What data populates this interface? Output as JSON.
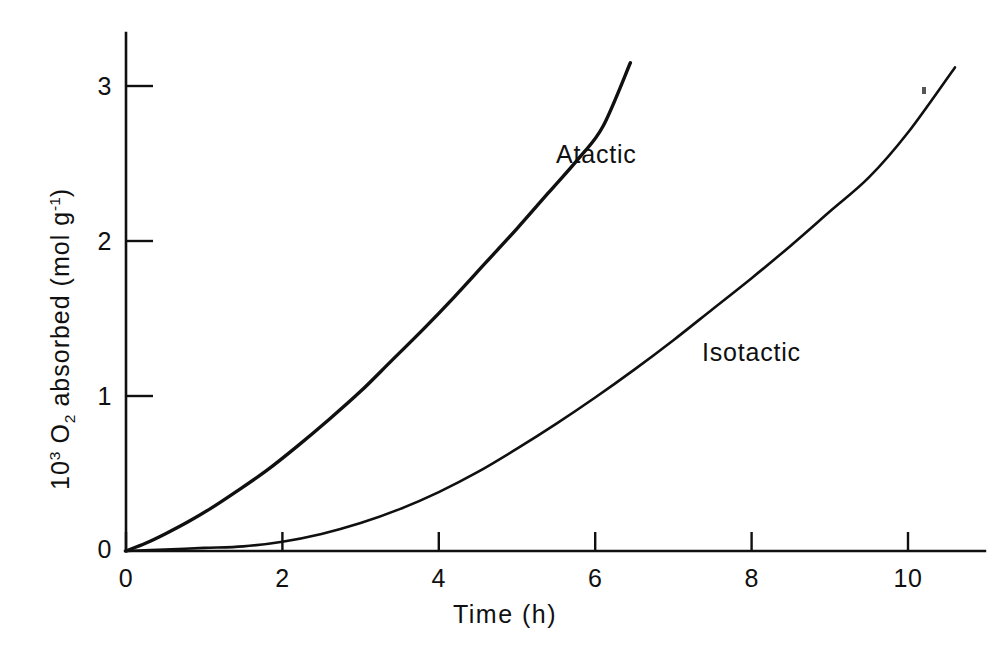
{
  "figure": {
    "background_color": "#ffffff",
    "ink_color": "#101010"
  },
  "axes": {
    "x": {
      "title": "Time (h)",
      "ticks": [
        0,
        2,
        4,
        6,
        8,
        10
      ],
      "tick_labels": [
        "0",
        "2",
        "4",
        "6",
        "8",
        "10"
      ],
      "range": [
        0,
        11.3
      ]
    },
    "y": {
      "title_parts": {
        "prefix": "10",
        "prefix_exp": "3",
        "species": "O",
        "species_sub": "2",
        "middle": " absorbed (mol g",
        "unit_exp": "-1",
        "suffix": ")"
      },
      "title_plain": "10^3 O2 absorbed (mol g^-1)",
      "ticks": [
        0,
        1,
        2,
        3
      ],
      "tick_labels": [
        "0",
        "1",
        "2",
        "3"
      ],
      "range": [
        0,
        3.34
      ]
    }
  },
  "series_labels": {
    "atactic": "Atactic",
    "isotactic": "Isotactic"
  },
  "chart_data": {
    "type": "line",
    "title": "",
    "xlabel": "Time (h)",
    "ylabel": "10^3 O2 absorbed (mol g^-1)",
    "xlim": [
      0,
      11.3
    ],
    "ylim": [
      0,
      3.34
    ],
    "xticks": [
      0,
      2,
      4,
      6,
      8,
      10
    ],
    "yticks": [
      0,
      1,
      2,
      3
    ],
    "grid": false,
    "legend": "inline-annotations",
    "annotations": [
      {
        "text": "Atactic",
        "x": 5.5,
        "y": 2.55
      },
      {
        "text": "Isotactic",
        "x": 7.35,
        "y": 1.27
      }
    ],
    "series": [
      {
        "name": "Atactic",
        "color": "#101010",
        "x": [
          0.0,
          0.25,
          0.5,
          0.8,
          1.1,
          1.4,
          1.8,
          2.2,
          2.6,
          3.0,
          3.4,
          3.8,
          4.2,
          4.6,
          5.0,
          5.4,
          5.8,
          6.1,
          6.45
        ],
        "y": [
          0.0,
          0.05,
          0.11,
          0.19,
          0.28,
          0.38,
          0.52,
          0.68,
          0.85,
          1.03,
          1.23,
          1.43,
          1.64,
          1.86,
          2.08,
          2.31,
          2.54,
          2.74,
          3.15
        ]
      },
      {
        "name": "Isotactic",
        "color": "#101010",
        "x": [
          0.0,
          0.5,
          1.0,
          1.5,
          2.0,
          2.5,
          3.0,
          3.5,
          4.0,
          4.5,
          5.0,
          5.5,
          6.0,
          6.5,
          7.0,
          7.5,
          8.0,
          8.5,
          9.0,
          9.5,
          10.0,
          10.6
        ],
        "y": [
          0.0,
          0.01,
          0.02,
          0.03,
          0.06,
          0.11,
          0.18,
          0.27,
          0.38,
          0.51,
          0.66,
          0.82,
          0.99,
          1.17,
          1.36,
          1.56,
          1.76,
          1.97,
          2.19,
          2.41,
          2.7,
          3.12
        ]
      }
    ]
  }
}
